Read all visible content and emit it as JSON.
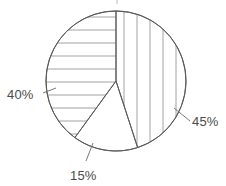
{
  "chart_data": {
    "type": "pie",
    "title": "",
    "subtitle": "",
    "xlabel": "",
    "ylabel": "",
    "legend_position": "none",
    "grid": false,
    "total": 100,
    "units": "percent",
    "categories": [
      "45%",
      "15%",
      "40%"
    ],
    "values": [
      45,
      15,
      40
    ],
    "labels": [
      "45%",
      "15%",
      "40%"
    ],
    "slices": [
      {
        "label": "45%",
        "value": 45,
        "start_angle_deg": 0,
        "end_angle_deg": 162,
        "fill": "vertical-hatch",
        "fill_color": "#ffffff",
        "hatch_color": "#8c8c8c",
        "label_position": "right",
        "label_x": 196,
        "label_y": 125
      },
      {
        "label": "15%",
        "value": 15,
        "start_angle_deg": 162,
        "end_angle_deg": 216,
        "fill": "none",
        "fill_color": "#ffffff",
        "hatch_color": "",
        "label_position": "bottom",
        "label_x": 70,
        "label_y": 179
      },
      {
        "label": "40%",
        "value": 40,
        "start_angle_deg": 216,
        "end_angle_deg": 360,
        "fill": "horizontal-hatch",
        "fill_color": "#ffffff",
        "hatch_color": "#8c8c8c",
        "label_position": "left",
        "label_x": 7,
        "label_y": 99
      }
    ],
    "geometry": {
      "center_x": 116,
      "center_y": 81,
      "radius": 70
    },
    "colors": {
      "background": "#ffffff",
      "outline": "#5a5a5a",
      "hatch": "#8c8c8c",
      "text": "#4a4a4a",
      "leader": "#6a6a6a"
    }
  },
  "labels": {
    "left": "40%",
    "right": "45%",
    "bottom": "15%"
  }
}
